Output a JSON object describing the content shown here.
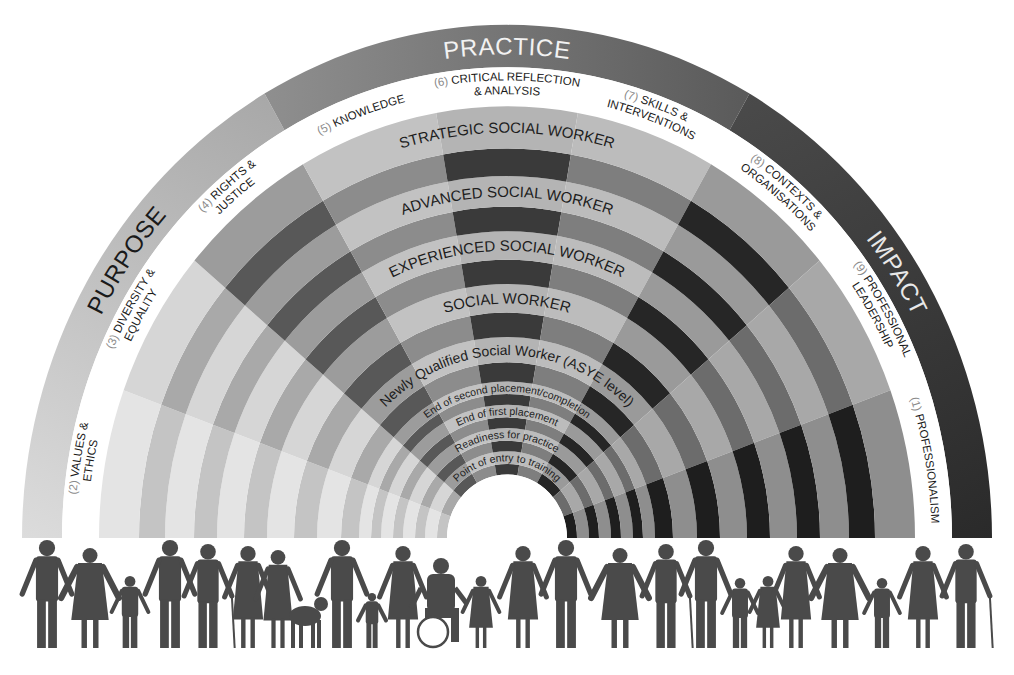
{
  "diagram": {
    "center": {
      "x": 507,
      "y": 538
    },
    "scale_y": 1.058,
    "radii": {
      "outer_band_outer": 485,
      "outer_band_inner": 445,
      "label_band_inner": 408,
      "hole": 60
    },
    "outer_bands": [
      {
        "label": "PURPOSE",
        "start_deg": 180,
        "end_deg": 120,
        "color_from": "#dcdcdc",
        "color_to": "#a8a8a8",
        "text_color": "#1a1a1a",
        "text_deg": 145
      },
      {
        "label": "PRACTICE",
        "start_deg": 120,
        "end_deg": 60,
        "color_from": "#8f8f8f",
        "color_to": "#5a5a5a",
        "text_color": "#f2f2f2",
        "text_deg": 90
      },
      {
        "label": "IMPACT",
        "start_deg": 60,
        "end_deg": 0,
        "color_from": "#4a4a4a",
        "color_to": "#2a2a2a",
        "text_color": "#e8e8e8",
        "text_deg": 33
      }
    ],
    "domains": [
      {
        "num": "(2)",
        "line1": "VALUES &",
        "line2": "ETHICS",
        "dark": "#c4c4c4",
        "light": "#e4e4e4"
      },
      {
        "num": "(3)",
        "line1": "DIVERSITY &",
        "line2": "EQUALITY",
        "dark": "#a9a9a9",
        "light": "#d6d6d6"
      },
      {
        "num": "(4)",
        "line1": "RIGHTS &",
        "line2": "JUSTICE",
        "dark": "#585858",
        "light": "#9c9c9c"
      },
      {
        "num": "(5)",
        "line1": "KNOWLEDGE",
        "line2": "",
        "dark": "#8c8c8c",
        "light": "#c2c2c2"
      },
      {
        "num": "(6)",
        "line1": "CRITICAL REFLECTION",
        "line2": "& ANALYSIS",
        "dark": "#3a3a3a",
        "light": "#b4b4b4"
      },
      {
        "num": "(7)",
        "line1": "SKILLS &",
        "line2": "INTERVENTIONS",
        "dark": "#7e7e7e",
        "light": "#bcbcbc"
      },
      {
        "num": "(8)",
        "line1": "CONTEXTS &",
        "line2": "ORGANISATIONS",
        "dark": "#262626",
        "light": "#9a9a9a"
      },
      {
        "num": "(9)",
        "line1": "PROFESSIONAL",
        "line2": "LEADERSHIP",
        "dark": "#6c6c6c",
        "light": "#a8a8a8"
      },
      {
        "num": "(1)",
        "line1": "PROFESSIONALISM",
        "line2": "",
        "dark": "#1e1e1e",
        "light": "#8e8e8e"
      }
    ],
    "levels": [
      {
        "label": "Point of entry to training",
        "r_in": 60,
        "r_mid": 70,
        "r_out": 82,
        "size": "small"
      },
      {
        "label": "Readiness for practice",
        "r_in": 82,
        "r_mid": 92,
        "r_out": 104,
        "size": "small"
      },
      {
        "label": "End of first placement",
        "r_in": 104,
        "r_mid": 114,
        "r_out": 126,
        "size": "small"
      },
      {
        "label": "End of second placement/completion",
        "r_in": 126,
        "r_mid": 136,
        "r_out": 148,
        "size": "small"
      },
      {
        "label": "Newly Qualified Social Worker (ASYE level)",
        "r_in": 148,
        "r_mid": 166,
        "r_out": 190,
        "size": "mid"
      },
      {
        "label": "SOCIAL WORKER",
        "r_in": 190,
        "r_mid": 213,
        "r_out": 240,
        "size": "big"
      },
      {
        "label": "EXPERIENCED SOCIAL WORKER",
        "r_in": 240,
        "r_mid": 263,
        "r_out": 290,
        "size": "big"
      },
      {
        "label": "ADVANCED SOCIAL WORKER",
        "r_in": 290,
        "r_mid": 313,
        "r_out": 342,
        "size": "big"
      },
      {
        "label": "STRATEGIC SOCIAL WORKER",
        "r_in": 342,
        "r_mid": 368,
        "r_out": 408,
        "size": "big"
      }
    ],
    "people": {
      "description": "Row of silhouettes of diverse people holding hands",
      "color": "#4a4a4a",
      "figures": [
        "man",
        "older-woman",
        "child",
        "man",
        "older-man-cane",
        "woman",
        "woman-guide-dog",
        "guide-dog",
        "man",
        "toddler",
        "woman",
        "wheelchair-user",
        "girl",
        "woman",
        "man",
        "older-woman",
        "older-man-cane",
        "man",
        "boy",
        "girl",
        "woman",
        "older-woman",
        "boy",
        "woman",
        "older-man-cane"
      ]
    }
  }
}
